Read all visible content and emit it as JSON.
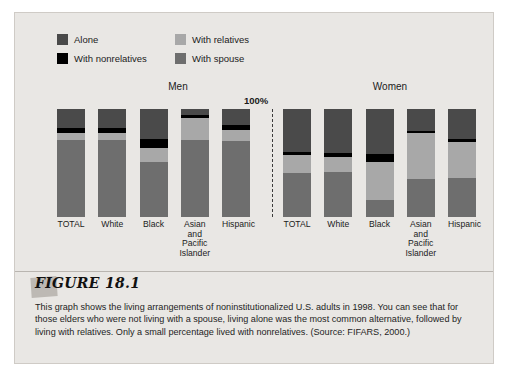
{
  "figure": {
    "tag": "FIGURE 18.1",
    "caption": "This graph shows the living arrangements of noninstitutionalized U.S. adults in 1998. You can see that for those elders who were not living with a spouse, living alone was the most common alternative, followed by living with relatives. Only a small percentage lived with nonrelatives. (Source: FIFARS, 2000.)"
  },
  "legend": {
    "items": [
      {
        "label": "Alone",
        "color": "#4a4a4a"
      },
      {
        "label": "With relatives",
        "color": "#a8a8a8"
      },
      {
        "label": "With nonrelatives",
        "color": "#000000"
      },
      {
        "label": "With spouse",
        "color": "#6e6e6e"
      }
    ]
  },
  "axis": {
    "top_marker": "100%"
  },
  "chart_data": {
    "type": "bar",
    "subtype": "stacked-percentage",
    "xlabel": "",
    "ylabel": "",
    "ylim": [
      0,
      100
    ],
    "grid": false,
    "legend_position": "top-left",
    "stack_order_top_to_bottom": [
      "Alone",
      "With nonrelatives",
      "With relatives",
      "With spouse"
    ],
    "panels": [
      {
        "name": "Men",
        "categories": [
          "TOTAL",
          "White",
          "Black",
          "Asian and Pacific Islander",
          "Hispanic"
        ],
        "series": [
          {
            "name": "Alone",
            "color": "#4a4a4a",
            "values": [
              18,
              18,
              28,
              6,
              15
            ]
          },
          {
            "name": "With nonrelatives",
            "color": "#000000",
            "values": [
              4,
              4,
              8,
              2,
              4
            ]
          },
          {
            "name": "With relatives",
            "color": "#a8a8a8",
            "values": [
              7,
              7,
              13,
              21,
              11
            ]
          },
          {
            "name": "With spouse",
            "color": "#6e6e6e",
            "values": [
              71,
              71,
              51,
              71,
              70
            ]
          }
        ]
      },
      {
        "name": "Women",
        "categories": [
          "TOTAL",
          "White",
          "Black",
          "Asian and Pacific Islander",
          "Hispanic"
        ],
        "series": [
          {
            "name": "Alone",
            "color": "#4a4a4a",
            "values": [
              40,
              41,
              42,
              20,
              28
            ]
          },
          {
            "name": "With nonrelatives",
            "color": "#000000",
            "values": [
              3,
              3,
              7,
              2,
              3
            ]
          },
          {
            "name": "With relatives",
            "color": "#a8a8a8",
            "values": [
              16,
              14,
              35,
              43,
              33
            ]
          },
          {
            "name": "With spouse",
            "color": "#6e6e6e",
            "values": [
              41,
              42,
              16,
              35,
              36
            ]
          }
        ]
      }
    ]
  },
  "colors": {
    "panel_background": "#e9e7e4",
    "page_background": "#ffffff",
    "text": "#1b1b1b"
  }
}
